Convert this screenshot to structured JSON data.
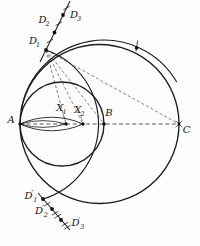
{
  "figure": {
    "kind": "geometric compass construction diagram",
    "colors": {
      "background": "#fdfdfd",
      "stroke": "#1c1c1c",
      "dashed_stroke": "#3f3f3f"
    },
    "labels": {
      "A": {
        "main": "A",
        "prime": "",
        "sub": ""
      },
      "B": {
        "main": "B",
        "prime": "",
        "sub": ""
      },
      "C": {
        "main": "C",
        "prime": "",
        "sub": ""
      },
      "X1": {
        "main": "X",
        "prime": "",
        "sub": "1"
      },
      "X2": {
        "main": "X",
        "prime": "",
        "sub": "2"
      },
      "D1": {
        "main": "D",
        "prime": "",
        "sub": "1"
      },
      "D2": {
        "main": "D",
        "prime": "",
        "sub": "2"
      },
      "D3": {
        "main": "D",
        "prime": "",
        "sub": "3"
      },
      "D1p": {
        "main": "D",
        "prime": "′",
        "sub": "1"
      },
      "D2p": {
        "main": "D",
        "prime": "′",
        "sub": "2"
      },
      "D3p": {
        "main": "D",
        "prime": "′",
        "sub": "3"
      }
    },
    "axis_point_order": [
      "A",
      "X1",
      "X2",
      "B",
      "C"
    ],
    "upper_ray_points": [
      "D1",
      "D2",
      "D3"
    ],
    "lower_ray_points": [
      "D1p",
      "D2p",
      "D3p"
    ]
  }
}
